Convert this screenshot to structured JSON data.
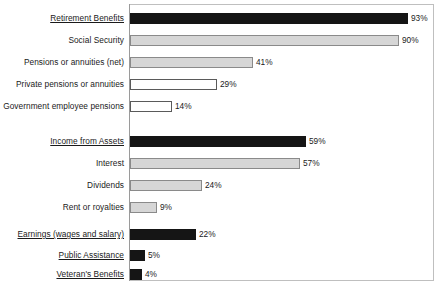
{
  "chart_data": {
    "type": "bar",
    "orientation": "horizontal",
    "title": "",
    "subtitle": "",
    "xlabel": "",
    "ylabel": "",
    "xlim": [
      0,
      100
    ],
    "grid": false,
    "legend": null,
    "value_suffix": "%",
    "categories": [
      "Retirement Benefits",
      "Social Security",
      "Pensions or annuities (net)",
      "Private pensions or annuities",
      "Government employee pensions",
      "Income from Assets",
      "Interest",
      "Dividends",
      "Rent or royalties",
      "Earnings (wages and salary)",
      "Public Assistance",
      "Veteran's Benefits"
    ],
    "values": [
      93,
      90,
      41,
      29,
      14,
      59,
      57,
      24,
      9,
      22,
      5,
      4
    ],
    "value_labels": [
      "93%",
      "90%",
      "41%",
      "29%",
      "14%",
      "59%",
      "57%",
      "24%",
      "9%",
      "22%",
      "5%",
      "4%"
    ],
    "colors": {
      "dark": "#151515",
      "gray": "#d6d6d6",
      "white": "#ffffff",
      "bar_outline": "#5a5a5a",
      "frame": "#bfbfbf",
      "text": "#1a1a1a"
    }
  },
  "rows": [
    {
      "label": "Retirement Benefits",
      "value": 93,
      "value_label": "93%",
      "fill": "fill-dark",
      "underlined": true,
      "top": 12
    },
    {
      "label": "Social Security",
      "value": 90,
      "value_label": "90%",
      "fill": "fill-gray",
      "underlined": false,
      "top": 34
    },
    {
      "label": "Pensions or annuities (net)",
      "value": 41,
      "value_label": "41%",
      "fill": "fill-gray",
      "underlined": false,
      "top": 56
    },
    {
      "label": "Private pensions or annuities",
      "value": 29,
      "value_label": "29%",
      "fill": "fill-white",
      "underlined": false,
      "top": 78
    },
    {
      "label": "Government employee pensions",
      "value": 14,
      "value_label": "14%",
      "fill": "fill-white",
      "underlined": false,
      "top": 100
    },
    {
      "label": "Income from Assets",
      "value": 59,
      "value_label": "59%",
      "fill": "fill-dark",
      "underlined": true,
      "top": 135
    },
    {
      "label": "Interest",
      "value": 57,
      "value_label": "57%",
      "fill": "fill-gray",
      "underlined": false,
      "top": 157
    },
    {
      "label": "Dividends",
      "value": 24,
      "value_label": "24%",
      "fill": "fill-gray",
      "underlined": false,
      "top": 179
    },
    {
      "label": "Rent or royalties",
      "value": 9,
      "value_label": "9%",
      "fill": "fill-gray",
      "underlined": false,
      "top": 201
    },
    {
      "label": "Earnings (wages and salary)",
      "value": 22,
      "value_label": "22%",
      "fill": "fill-dark",
      "underlined": true,
      "top": 228
    },
    {
      "label": " Public Assistance",
      "value": 5,
      "value_label": "5%",
      "fill": "fill-dark",
      "underlined": true,
      "top": 249
    },
    {
      "label": "Veteran's Benefits",
      "value": 4,
      "value_label": "4%",
      "fill": "fill-dark",
      "underlined": true,
      "top": 268
    }
  ],
  "scale": {
    "px_per_percent": 2.99,
    "bar_origin_x": 130
  }
}
